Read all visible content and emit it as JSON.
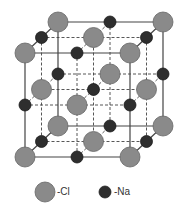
{
  "diagram": {
    "lattice": {
      "front_x": [
        25,
        77,
        130
      ],
      "front_y": [
        53,
        105,
        157
      ],
      "depth_offset": [
        16.5,
        -15.5
      ],
      "cl_radius": 10,
      "na_radius": 6,
      "cl_color": "#8a8a8a",
      "na_color": "#2e2e2e",
      "edge_color": "#444444"
    },
    "legend": {
      "items": [
        {
          "label": "-Cl",
          "kind": "cl"
        },
        {
          "label": "-Na",
          "kind": "na"
        }
      ]
    }
  }
}
